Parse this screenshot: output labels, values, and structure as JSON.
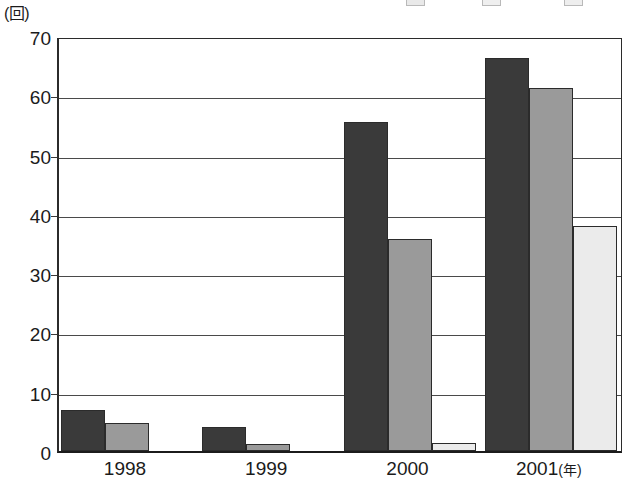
{
  "chart_data": {
    "type": "bar",
    "title": "",
    "subtitle": "",
    "xlabel": "年",
    "ylabel": "回",
    "y_unit_caption": "(回)",
    "x_unit_caption": "(年)",
    "categories": [
      "1998",
      "1999",
      "2000",
      "2001"
    ],
    "series": [
      {
        "name": "series-1",
        "color": "#3a3a3a",
        "values": [
          7,
          4,
          55.5,
          66.3
        ]
      },
      {
        "name": "series-2",
        "color": "#9a9a9a",
        "values": [
          4.8,
          1.2,
          35.8,
          61.2
        ]
      },
      {
        "name": "series-3",
        "color": "#ebebeb",
        "values": [
          0,
          0,
          1.3,
          38.0
        ]
      }
    ],
    "ylim": [
      0,
      70
    ],
    "yticks": [
      0,
      10,
      20,
      30,
      40,
      50,
      60,
      70
    ],
    "ytick_labels": [
      "0",
      "10",
      "20",
      "30",
      "40",
      "50",
      "60",
      "70"
    ],
    "grid": true,
    "grid_axis": "y",
    "legend": "clipped-top",
    "legend_visible": false
  },
  "axis": {
    "y_caption": "(回)",
    "x_captions": [
      "1998",
      "1999",
      "2000",
      "2001"
    ],
    "x_unit": "(年)"
  }
}
